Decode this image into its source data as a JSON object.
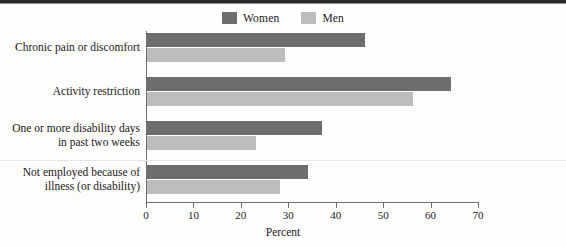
{
  "chart_data": {
    "type": "bar",
    "orientation": "horizontal",
    "title": "",
    "xlabel": "Percent",
    "ylabel": "",
    "xlim": [
      0,
      70
    ],
    "xticks": [
      0,
      10,
      20,
      30,
      40,
      50,
      60,
      70
    ],
    "xtick_labels": [
      "0",
      "10",
      "20",
      "30",
      "40",
      "50",
      "60",
      "70"
    ],
    "grid": false,
    "legend_position": "top-center",
    "categories": [
      "Chronic pain or discomfort",
      "Activity restriction",
      "One or more disability days in past two weeks",
      "Not employed because of illness (or disability)"
    ],
    "series": [
      {
        "name": "Women",
        "color": "#6d6d6d",
        "values": [
          46,
          64,
          37,
          34
        ]
      },
      {
        "name": "Men",
        "color": "#bdbdbd",
        "values": [
          29,
          56,
          23,
          28
        ]
      }
    ]
  },
  "legend": {
    "items": [
      {
        "label": "Women",
        "color": "#6d6d6d"
      },
      {
        "label": "Men",
        "color": "#bdbdbd"
      }
    ]
  },
  "axis": {
    "x_title": "Percent",
    "ticks": [
      "0",
      "10",
      "20",
      "30",
      "40",
      "50",
      "60",
      "70"
    ]
  },
  "rows": [
    {
      "label_line1": "Chronic pain or discomfort",
      "label_line2": "",
      "women": 46,
      "men": 29
    },
    {
      "label_line1": "Activity restriction",
      "label_line2": "",
      "women": 64,
      "men": 56
    },
    {
      "label_line1": "One or more disability days",
      "label_line2": "in past two weeks",
      "women": 37,
      "men": 23
    },
    {
      "label_line1": "Not employed because of",
      "label_line2": "illness (or disability)",
      "women": 34,
      "men": 28
    }
  ]
}
